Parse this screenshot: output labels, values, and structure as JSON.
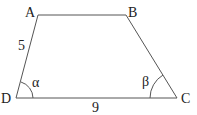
{
  "diagram": {
    "type": "trapezoid",
    "vertices": [
      {
        "name": "A",
        "x": 38,
        "y": 15
      },
      {
        "name": "B",
        "x": 126,
        "y": 15
      },
      {
        "name": "C",
        "x": 177,
        "y": 98
      },
      {
        "name": "D",
        "x": 16,
        "y": 98
      }
    ],
    "side_labels": {
      "AD": "5",
      "DC": "9"
    },
    "angle_labels": {
      "D": "α",
      "C": "β"
    },
    "colors": {
      "stroke": "#555555",
      "text": "#222222",
      "background": "#ffffff"
    }
  }
}
